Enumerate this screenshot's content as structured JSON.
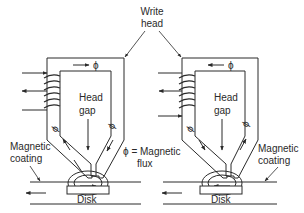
{
  "labels": {
    "write_head": [
      "Write",
      "head"
    ],
    "head_gap_left": [
      "Head",
      "gap"
    ],
    "head_gap_right": [
      "Head",
      "gap"
    ],
    "phi_equals": [
      "ϕ = Magnetic",
      "flux"
    ],
    "magnetic_coating_left": [
      "Magnetic",
      "coating"
    ],
    "magnetic_coating_right": [
      "Magnetic",
      "coating"
    ],
    "disk_left": "Disk",
    "disk_right": "Disk",
    "phi": "ϕ"
  },
  "heads": [
    {
      "id": "left",
      "flux_direction_top": "right",
      "flux_left_leg": "up",
      "flux_right_leg": "down",
      "disk_motion": "left"
    },
    {
      "id": "right",
      "flux_direction_top": "left",
      "flux_left_leg": "down",
      "flux_right_leg": "up",
      "disk_motion": "left"
    }
  ],
  "colors": {
    "line": "#2a2a2a",
    "background": "#ffffff"
  }
}
